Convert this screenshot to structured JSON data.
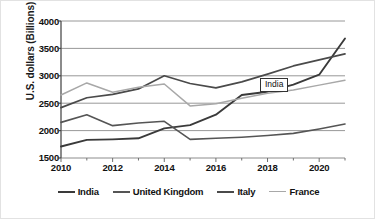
{
  "chart_data": {
    "type": "line",
    "title": "",
    "xlabel": "",
    "ylabel": "U.S. dollars (Billions)",
    "xlim": [
      2010,
      2021
    ],
    "ylim": [
      1500,
      4000
    ],
    "y_ticks": [
      1500,
      2000,
      2500,
      3000,
      3500,
      4000
    ],
    "x_ticks": [
      2010,
      2012,
      2014,
      2016,
      2018,
      2020
    ],
    "x": [
      2010,
      2011,
      2012,
      2013,
      2014,
      2015,
      2016,
      2017,
      2018,
      2019,
      2020,
      2021
    ],
    "grid": true,
    "legend_position": "bottom",
    "annotations": [
      {
        "text": "India",
        "x": 2017.9,
        "y": 2790
      }
    ],
    "series": [
      {
        "name": "India",
        "color": "#3a3a3a",
        "width": 1.9,
        "values": [
          1710,
          1830,
          1840,
          1860,
          2040,
          2100,
          2290,
          2650,
          2710,
          2840,
          3020,
          3680
        ]
      },
      {
        "name": "United Kingdom",
        "color": "#555555",
        "width": 1.6,
        "values": [
          2150,
          2290,
          2090,
          2140,
          2170,
          1840,
          1860,
          1880,
          1910,
          1950,
          2030,
          2120
        ]
      },
      {
        "name": "Italy",
        "color": "#4a4a4a",
        "width": 1.7,
        "values": [
          2420,
          2600,
          2660,
          2760,
          3000,
          2860,
          2780,
          2890,
          3030,
          3180,
          3290,
          3400
        ]
      },
      {
        "name": "France",
        "color": "#a8a8a8",
        "width": 1.5,
        "values": [
          2650,
          2870,
          2700,
          2790,
          2850,
          2450,
          2490,
          2590,
          2680,
          2740,
          2830,
          2920
        ]
      }
    ]
  },
  "y_axis": {
    "title": "U.S. dollars (Billions)",
    "ticks": [
      "4000",
      "3500",
      "3000",
      "2500",
      "2000",
      "1500"
    ]
  },
  "x_axis": {
    "ticks": [
      "2010",
      "2012",
      "2014",
      "2016",
      "2018",
      "2020"
    ]
  },
  "annotation": {
    "india_label": "India"
  },
  "legend": {
    "items": [
      {
        "label": "India",
        "color": "#3a3a3a",
        "width": "2px"
      },
      {
        "label": "United Kingdom",
        "color": "#555555",
        "width": "2px"
      },
      {
        "label": "Italy",
        "color": "#4a4a4a",
        "width": "2px"
      },
      {
        "label": "France",
        "color": "#a8a8a8",
        "width": "1.6px"
      }
    ]
  },
  "colors": {
    "grid": "#8c8c8c",
    "axis": "#6f6f6f",
    "text": "#111111",
    "background": "#ffffff"
  }
}
